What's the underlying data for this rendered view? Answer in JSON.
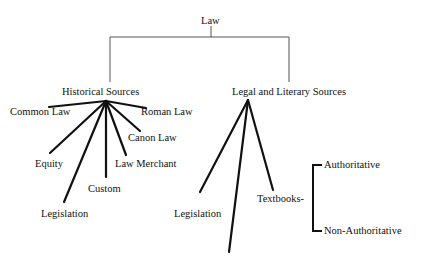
{
  "diagram": {
    "root": {
      "label": "Law"
    },
    "branches": [
      {
        "label": "Historical Sources",
        "children": [
          "Common Law",
          "Roman Law",
          "Canon Law",
          "Equity",
          "Law Merchant",
          "Custom",
          "Legislation"
        ]
      },
      {
        "label": "Legal and Literary Sources",
        "children": [
          "Legislation",
          "",
          "Textbooks-"
        ],
        "textbooks_subtypes": [
          "Authoritative",
          "Non-Authoritative"
        ]
      }
    ]
  }
}
